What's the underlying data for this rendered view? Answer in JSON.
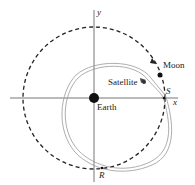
{
  "diagram": {
    "labels": {
      "y_axis": "y",
      "x_axis": "x",
      "moon": "Moon",
      "satellite": "Satellite",
      "earth": "Earth",
      "point_s": "S",
      "point_r": "R"
    },
    "colors": {
      "line": "#222222",
      "axis": "#666666",
      "orbit": "#888888"
    }
  }
}
